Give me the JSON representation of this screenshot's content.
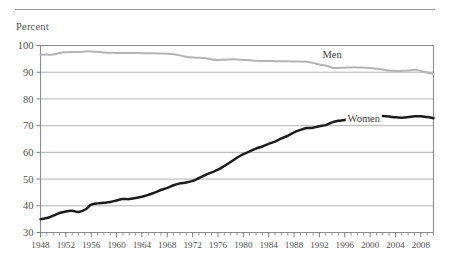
{
  "figure": {
    "axis_title": "Percent",
    "has_top_rule": true
  },
  "chart_data": {
    "type": "line",
    "title": "",
    "subtitle": "",
    "xlabel": "",
    "ylabel": "Percent",
    "ylim": [
      30,
      100
    ],
    "xlim": [
      1948,
      2010
    ],
    "ytick_step": 10,
    "yticks": [
      30,
      40,
      50,
      60,
      70,
      80,
      90,
      100
    ],
    "xticks": [
      1948,
      1952,
      1956,
      1960,
      1964,
      1968,
      1972,
      1976,
      1980,
      1984,
      1988,
      1992,
      1996,
      2000,
      2004,
      2008
    ],
    "xtick_minor_step": 1,
    "grid": true,
    "grid_axis": "y",
    "legend_position": "inline-annotation",
    "x": [
      1948,
      1949,
      1950,
      1951,
      1952,
      1953,
      1954,
      1955,
      1956,
      1957,
      1958,
      1959,
      1960,
      1961,
      1962,
      1963,
      1964,
      1965,
      1966,
      1967,
      1968,
      1969,
      1970,
      1971,
      1972,
      1973,
      1974,
      1975,
      1976,
      1977,
      1978,
      1979,
      1980,
      1981,
      1982,
      1983,
      1984,
      1985,
      1986,
      1987,
      1988,
      1989,
      1990,
      1991,
      1992,
      1993,
      1994,
      1995,
      1996,
      1997,
      1998,
      1999,
      2000,
      2001,
      2002,
      2003,
      2004,
      2005,
      2006,
      2007,
      2008,
      2009,
      2010
    ],
    "series": [
      {
        "name": "Men",
        "color": "#b4b4b4",
        "annotation": "Men",
        "annotation_x": 1994,
        "annotation_y": 95.5,
        "values": [
          96.5,
          96.6,
          96.6,
          97.2,
          97.5,
          97.6,
          97.6,
          97.8,
          97.8,
          97.6,
          97.4,
          97.3,
          97.2,
          97.2,
          97.2,
          97.2,
          97.1,
          97.1,
          97.1,
          97.0,
          96.9,
          96.7,
          96.3,
          95.8,
          95.5,
          95.4,
          95.2,
          94.8,
          94.6,
          94.7,
          94.8,
          94.8,
          94.6,
          94.5,
          94.3,
          94.2,
          94.2,
          94.1,
          94.1,
          94.1,
          94.0,
          94.0,
          93.9,
          93.5,
          92.9,
          92.5,
          91.7,
          91.6,
          91.7,
          91.8,
          91.8,
          91.7,
          91.6,
          91.3,
          91.0,
          90.6,
          90.5,
          90.5,
          90.6,
          90.9,
          90.5,
          89.9,
          89.3
        ]
      },
      {
        "name": "Women",
        "color": "#1c1c1c",
        "annotation": "Women",
        "annotation_x": 1999,
        "annotation_y": 71.5,
        "values": [
          35.0,
          35.4,
          36.3,
          37.3,
          37.9,
          38.1,
          37.7,
          38.5,
          40.4,
          40.9,
          41.1,
          41.4,
          42.0,
          42.5,
          42.5,
          42.9,
          43.4,
          44.1,
          44.9,
          45.9,
          46.7,
          47.7,
          48.4,
          48.7,
          49.3,
          50.4,
          51.5,
          52.5,
          53.5,
          54.9,
          56.4,
          58.0,
          59.3,
          60.4,
          61.4,
          62.2,
          63.2,
          64.0,
          65.2,
          66.2,
          67.5,
          68.4,
          69.1,
          69.2,
          69.8,
          70.2,
          71.2,
          71.8,
          72.1,
          72.8,
          73.5,
          73.6,
          73.9,
          73.7,
          73.6,
          73.4,
          73.1,
          73.0,
          73.2,
          73.5,
          73.5,
          73.2,
          72.8
        ]
      }
    ]
  },
  "annotations": {
    "men_label": "Men",
    "women_label": "Women"
  },
  "colors": {
    "men_line": "#b4b4b4",
    "women_line": "#1c1c1c",
    "gridline": "#a9a9a9",
    "axis": "#8c8c8c",
    "text": "#4f4f4f",
    "background": "#ffffff"
  }
}
